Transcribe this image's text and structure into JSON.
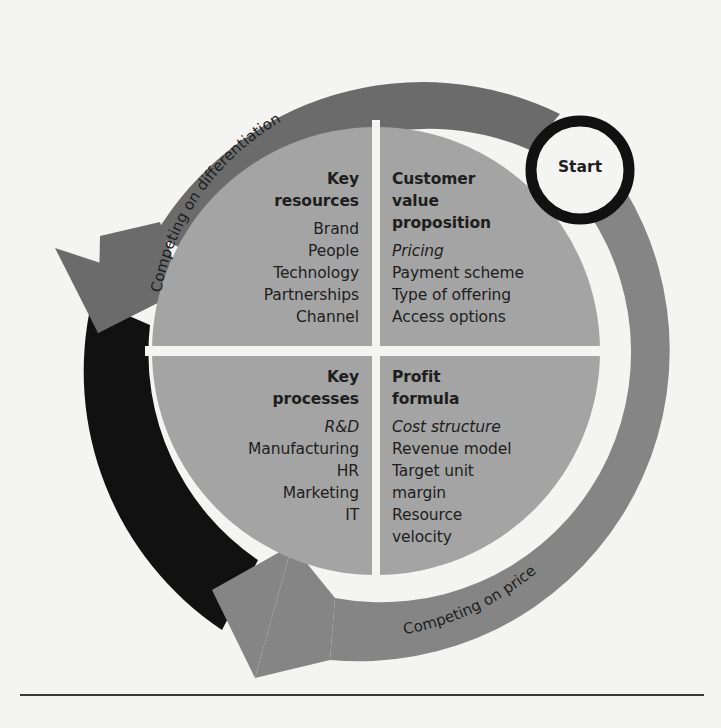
{
  "colors": {
    "background": "#f4f4f3",
    "ring_dark_gray": "#6b6b6b",
    "ring_mid_gray": "#7d7d7d",
    "ring_black": "#111111",
    "ring_price_gray": "#858585",
    "disc_gray": "#a4a4a4",
    "gap_white": "#f4f4f3",
    "text": "#1e1e1e"
  },
  "start": {
    "label": "Start"
  },
  "arrows": {
    "differentiation": {
      "label": "Competing on differentiation"
    },
    "price": {
      "label": "Competing on price"
    }
  },
  "quadrants": {
    "key_resources": {
      "title_lines": [
        "Key",
        "resources"
      ],
      "items": [
        {
          "text": "Brand",
          "italic": false
        },
        {
          "text": "People",
          "italic": false
        },
        {
          "text": "Technology",
          "italic": false
        },
        {
          "text": "Partnerships",
          "italic": false
        },
        {
          "text": "Channel",
          "italic": false
        }
      ]
    },
    "customer_value_proposition": {
      "title_lines": [
        "Customer",
        "value",
        "proposition"
      ],
      "items": [
        {
          "text": "Pricing",
          "italic": true
        },
        {
          "text": "Payment scheme",
          "italic": false
        },
        {
          "text": "Type of offering",
          "italic": false
        },
        {
          "text": "Access options",
          "italic": false
        }
      ]
    },
    "key_processes": {
      "title_lines": [
        "Key",
        "processes"
      ],
      "items": [
        {
          "text": "R&D",
          "italic": true
        },
        {
          "text": "Manufacturing",
          "italic": false
        },
        {
          "text": "HR",
          "italic": false
        },
        {
          "text": "Marketing",
          "italic": false
        },
        {
          "text": "IT",
          "italic": false
        }
      ]
    },
    "profit_formula": {
      "title_lines": [
        "Profit",
        "formula"
      ],
      "items": [
        {
          "text": "Cost structure",
          "italic": true
        },
        {
          "text": "Revenue model",
          "italic": false
        },
        {
          "text": "Target unit",
          "italic": false
        },
        {
          "text": "margin",
          "italic": false
        },
        {
          "text": "Resource",
          "italic": false
        },
        {
          "text": "velocity",
          "italic": false
        }
      ]
    }
  }
}
